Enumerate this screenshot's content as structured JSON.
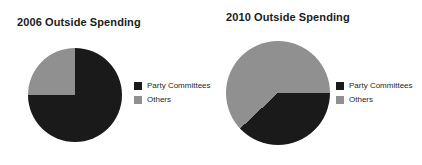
{
  "colors": {
    "party_committees": "#1a1a1a",
    "others": "#909090",
    "background": "#ffffff",
    "text": "#1b1b1b"
  },
  "charts": [
    {
      "id": "2006",
      "title": "2006 Outside Spending",
      "legend": [
        {
          "label": "Party Committees",
          "color": "#1a1a1a"
        },
        {
          "label": "Others",
          "color": "#909090"
        }
      ]
    },
    {
      "id": "2010",
      "title": "2010 Outside Spending",
      "legend": [
        {
          "label": "Party Committees",
          "color": "#1a1a1a"
        },
        {
          "label": "Others",
          "color": "#909090"
        }
      ]
    }
  ],
  "chart_data": [
    {
      "type": "pie",
      "title": "2006 Outside Spending",
      "labels": [
        "Party Committees",
        "Others"
      ],
      "values": [
        75,
        25
      ],
      "colors": [
        "#1a1a1a",
        "#909090"
      ],
      "start_angle_deg": 0,
      "legend_position": "right",
      "notes": "Gray 'Others' wedge spans from 12 o'clock clockwise to 3 o'clock; remainder black."
    },
    {
      "type": "pie",
      "title": "2010 Outside Spending",
      "labels": [
        "Party Committees",
        "Others"
      ],
      "values": [
        38,
        62
      ],
      "colors": [
        "#1a1a1a",
        "#909090"
      ],
      "start_angle_deg": 90,
      "legend_position": "right",
      "notes": "Black 'Party Committees' wedge spans from 3 o'clock clockwise to about 7:30; remainder gray."
    }
  ]
}
